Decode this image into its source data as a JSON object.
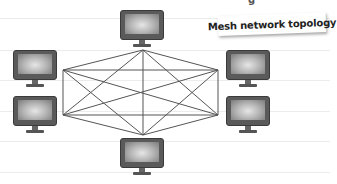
{
  "diagram": {
    "title": "Mesh network topology",
    "title_fragment": "g",
    "type": "mesh-network",
    "nodes": [
      {
        "id": "top",
        "label": "computer",
        "x": 120,
        "y": 10,
        "anchor": [
          143,
          50
        ]
      },
      {
        "id": "left-top",
        "label": "computer",
        "x": 13,
        "y": 50,
        "anchor": [
          63,
          70
        ]
      },
      {
        "id": "left-bottom",
        "label": "computer",
        "x": 13,
        "y": 96,
        "anchor": [
          63,
          115
        ]
      },
      {
        "id": "right-top",
        "label": "computer",
        "x": 226,
        "y": 50,
        "anchor": [
          218,
          70
        ]
      },
      {
        "id": "right-bottom",
        "label": "computer",
        "x": 226,
        "y": 96,
        "anchor": [
          218,
          115
        ]
      },
      {
        "id": "bottom",
        "label": "computer",
        "x": 120,
        "y": 138,
        "anchor": [
          143,
          135
        ]
      }
    ],
    "connections": "every node connected to every other node (15 links)",
    "colors": {
      "line": "#555555",
      "monitor": "#5a5a5a",
      "background": "#ffffff",
      "ruled_line": "#ececec"
    }
  }
}
